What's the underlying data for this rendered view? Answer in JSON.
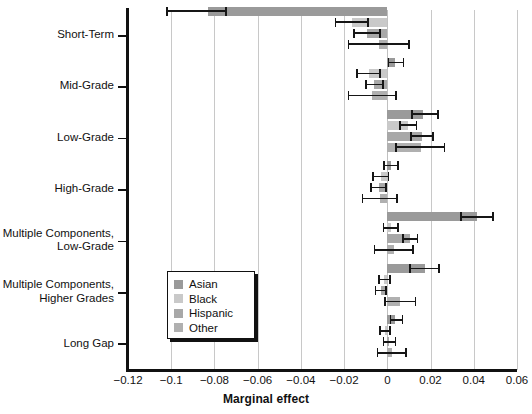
{
  "chart_data": {
    "type": "bar",
    "orientation": "horizontal",
    "title": "",
    "xlabel": "Marginal effect",
    "ylabel": "",
    "xlim": [
      -0.12,
      0.06
    ],
    "ylim": [
      0,
      7
    ],
    "grid": "vertical",
    "legend_position": "inside-lower-left",
    "xticks": [
      "-0.12",
      "-0.1",
      "-0.08",
      "-0.06",
      "-0.04",
      "-0.02",
      "0",
      "0.02",
      "0.04",
      "0.06"
    ],
    "xtick_values": [
      -0.12,
      -0.1,
      -0.08,
      -0.06,
      -0.04,
      -0.02,
      0,
      0.02,
      0.04,
      0.06
    ],
    "categories": [
      "Short-Term",
      "Mid-Grade",
      "Low-Grade",
      "High-Grade",
      "Multiple Components,\nLow-Grade",
      "Multiple Components,\nHigher Grades",
      "Long Gap"
    ],
    "series": [
      {
        "name": "Asian",
        "color": "#9a9a9a",
        "values": [
          -0.083,
          0.0035,
          0.0165,
          0.0015,
          0.0415,
          0.0175,
          0.0037
        ],
        "ci_low": [
          -0.102,
          0.0005,
          0.0115,
          -0.0015,
          0.034,
          0.0105,
          0.0015
        ],
        "ci_high": [
          -0.0745,
          0.0075,
          0.0235,
          0.005,
          0.049,
          0.024,
          0.007
        ]
      },
      {
        "name": "Black",
        "color": "#c9c9c9",
        "values": [
          -0.0165,
          -0.0085,
          0.0095,
          -0.003,
          0.0015,
          -0.0015,
          -0.001
        ],
        "ci_low": [
          -0.024,
          -0.014,
          0.006,
          -0.0065,
          -0.0018,
          -0.004,
          -0.0033
        ],
        "ci_high": [
          -0.009,
          -0.0035,
          0.0135,
          0.0005,
          0.0048,
          0.0012,
          0.0013
        ]
      },
      {
        "name": "Hispanic",
        "color": "#a8a8a8",
        "values": [
          -0.0095,
          -0.006,
          0.016,
          -0.004,
          0.0105,
          -0.003,
          0.001
        ],
        "ci_low": [
          -0.0155,
          -0.01,
          0.011,
          -0.0075,
          0.0072,
          -0.0055,
          -0.0018
        ],
        "ci_high": [
          -0.0035,
          -0.002,
          0.021,
          -0.0005,
          0.014,
          -0.0005,
          0.0038
        ]
      },
      {
        "name": "Other",
        "color": "#b0b0b0",
        "values": [
          -0.004,
          -0.007,
          0.0155,
          -0.0035,
          0.003,
          0.006,
          0.002
        ],
        "ci_low": [
          -0.018,
          -0.018,
          0.004,
          -0.0115,
          -0.006,
          -0.001,
          -0.0045
        ],
        "ci_high": [
          0.01,
          0.004,
          0.0265,
          0.0045,
          0.012,
          0.013,
          0.0085
        ]
      }
    ]
  },
  "legend": {
    "items": [
      {
        "label": "Asian"
      },
      {
        "label": "Black"
      },
      {
        "label": "Hispanic"
      },
      {
        "label": "Other"
      }
    ]
  },
  "axis": {
    "x_title": "Marginal effect"
  }
}
